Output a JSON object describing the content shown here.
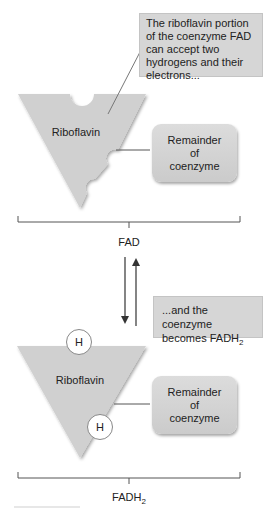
{
  "top_panel": {
    "callout": "The riboflavin portion of the coenzyme FAD can accept two hydrogens and their electrons...",
    "riboflavin_label": "Riboflavin",
    "remainder_label": [
      "Remainder",
      "of",
      "coenzyme"
    ],
    "bracket_label": "FAD"
  },
  "arrows": {
    "forward": "down",
    "reverse": "up"
  },
  "bottom_panel": {
    "callout_main": "...and the coenzyme becomes FADH",
    "callout_sub": "2",
    "riboflavin_label": "Riboflavin",
    "hydrogen_labels": [
      "H",
      "H"
    ],
    "remainder_label": [
      "Remainder",
      "of",
      "coenzyme"
    ],
    "bracket_label_main": "FADH",
    "bracket_label_sub": "2"
  },
  "colors": {
    "shape_fill": "#cfcfcf",
    "callout_fill": "#d6d6d6",
    "line": "#555555"
  }
}
